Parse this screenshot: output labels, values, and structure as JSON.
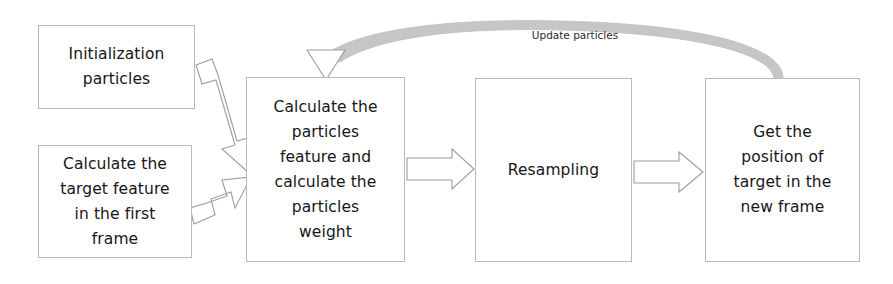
{
  "diagram": {
    "type": "flowchart",
    "background_color": "#ffffff",
    "box_border_color": "#b9b9b9",
    "arrow_outline_color": "#9a9a9a",
    "arrow_fill_color": "#ffffff",
    "feedback_arc_color": "#c2c2c2",
    "nodes": [
      {
        "id": "init",
        "label": "Initialization\nparticles"
      },
      {
        "id": "target_feature",
        "label": "Calculate the\ntarget feature\nin the first\nframe"
      },
      {
        "id": "particles_weight",
        "label": "Calculate the\nparticles\nfeature and\ncalculate the\nparticles\nweight"
      },
      {
        "id": "resampling",
        "label": "Resampling"
      },
      {
        "id": "get_position",
        "label": "Get the\nposition of\ntarget in the\nnew frame"
      }
    ],
    "edges": [
      {
        "id": "init-to-weight",
        "from": "init",
        "to": "particles_weight",
        "label": ""
      },
      {
        "id": "target-to-weight",
        "from": "target_feature",
        "to": "particles_weight",
        "label": ""
      },
      {
        "id": "weight-to-resampling",
        "from": "particles_weight",
        "to": "resampling",
        "label": ""
      },
      {
        "id": "resampling-to-position",
        "from": "resampling",
        "to": "get_position",
        "label": ""
      },
      {
        "id": "position-to-weight-feedback",
        "from": "get_position",
        "to": "particles_weight",
        "label": "Update particles"
      }
    ],
    "feedback_label": "Update particles"
  }
}
